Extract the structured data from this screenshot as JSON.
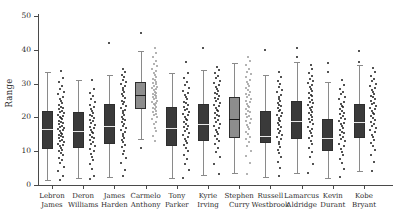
{
  "chart_data": {
    "type": "box",
    "title": "",
    "xlabel": "",
    "ylabel": "Range",
    "ylim": [
      0,
      50
    ],
    "yticks": [
      0,
      10,
      20,
      30,
      40,
      50
    ],
    "grid": false,
    "legend": "none",
    "categories": [
      "Lebron\nJames",
      "Deron\nWilliams",
      "James\nHarden",
      "Carmelo\nAnthony",
      "Tony\nParker",
      "Kyrie\nIrving",
      "Stephen\nCurry",
      "Russell\nWestbrook",
      "Lamarcus\nAldridge",
      "Kevin\nDurant",
      "Kobe\nBryant"
    ],
    "tick_labels": [
      {
        "line1": "Lebron",
        "line2": "James"
      },
      {
        "line1": "Deron",
        "line2": "Williams"
      },
      {
        "line1": "James",
        "line2": "Harden"
      },
      {
        "line1": "Carmelo",
        "line2": "Anthony"
      },
      {
        "line1": "Tony",
        "line2": "Parker"
      },
      {
        "line1": "Kyrie",
        "line2": "Irving"
      },
      {
        "line1": "Stephen",
        "line2": "Curry"
      },
      {
        "line1": "Russell",
        "line2": "Westbrook"
      },
      {
        "line1": "Lamarcus",
        "line2": "Aldridge"
      },
      {
        "line1": "Kevin",
        "line2": "Durant"
      },
      {
        "line1": "Kobe",
        "line2": "Bryant"
      }
    ],
    "box_color_dark": "#3a3a3a",
    "box_color_light": "#8d8d8d",
    "point_color": "#1a1a1a",
    "point_color_light": "#9a9a9a",
    "boxes": [
      {
        "name": "Lebron James",
        "q1": 10.5,
        "median": 16.5,
        "q3": 22.0,
        "whislo": 1.5,
        "whishi": 33.5,
        "shade": "dark",
        "fliers": [],
        "points": [
          33.8,
          31.6,
          30.4,
          29.3,
          28.5,
          27.6,
          26.8,
          26.1,
          25.4,
          24.8,
          24.2,
          23.7,
          23.2,
          22.8,
          22.4,
          22.0,
          21.6,
          21.2,
          20.8,
          20.4,
          20.1,
          19.7,
          19.4,
          19.0,
          18.7,
          18.3,
          18.0,
          17.6,
          17.3,
          16.9,
          16.6,
          16.2,
          15.9,
          15.5,
          15.2,
          14.8,
          14.5,
          14.1,
          13.8,
          13.4,
          13.0,
          12.6,
          12.2,
          11.8,
          11.4,
          11.0,
          10.5,
          10.0,
          9.4,
          8.8,
          8.1,
          7.3,
          6.4,
          5.4,
          4.2,
          2.6,
          1.4
        ]
      },
      {
        "name": "Deron Williams",
        "q1": 11.0,
        "median": 16.0,
        "q3": 21.5,
        "whislo": 2.0,
        "whishi": 31.0,
        "shade": "dark",
        "fliers": [],
        "points": [
          31.2,
          28.4,
          27.2,
          26.2,
          25.3,
          24.5,
          23.8,
          23.1,
          22.5,
          21.9,
          21.3,
          20.8,
          20.3,
          19.8,
          19.3,
          18.8,
          18.3,
          17.8,
          17.3,
          16.8,
          16.3,
          15.8,
          15.3,
          14.8,
          14.3,
          13.8,
          13.2,
          12.6,
          12.0,
          11.4,
          10.7,
          10.0,
          9.2,
          8.3,
          7.3,
          6.1,
          4.6,
          2.7,
          1.8
        ]
      },
      {
        "name": "James Harden",
        "q1": 12.0,
        "median": 17.5,
        "q3": 24.0,
        "whislo": 2.5,
        "whishi": 32.5,
        "shade": "dark",
        "fliers": [
          42.0
        ],
        "points": [
          34.2,
          33.4,
          32.6,
          31.9,
          31.2,
          30.5,
          29.9,
          29.2,
          28.6,
          28.0,
          27.4,
          26.8,
          26.2,
          25.6,
          25.0,
          24.5,
          23.9,
          23.4,
          22.8,
          22.3,
          21.8,
          21.2,
          20.7,
          20.2,
          19.6,
          19.1,
          18.6,
          18.0,
          17.5,
          16.9,
          16.4,
          15.8,
          15.2,
          14.6,
          14.0,
          13.3,
          12.6,
          11.9,
          11.1,
          10.2,
          9.2,
          8.0,
          6.5,
          4.5,
          2.6
        ]
      },
      {
        "name": "Carmelo Anthony",
        "q1": 22.5,
        "median": 26.5,
        "q3": 30.5,
        "whislo": 13.5,
        "whishi": 39.5,
        "shade": "light",
        "fliers": [
          45.0,
          11.0
        ],
        "points": [
          40.5,
          39.0,
          37.8,
          36.8,
          35.9,
          35.1,
          34.4,
          33.7,
          33.1,
          32.5,
          32.0,
          31.5,
          31.0,
          30.6,
          30.2,
          29.8,
          29.4,
          29.0,
          28.7,
          28.3,
          28.0,
          27.6,
          27.3,
          27.0,
          26.6,
          26.3,
          26.0,
          25.6,
          25.3,
          25.0,
          24.6,
          24.3,
          23.9,
          23.6,
          23.2,
          22.8,
          22.4,
          22.0,
          21.6,
          21.1,
          20.6,
          20.0,
          19.4,
          18.7,
          17.9,
          17.0,
          15.9,
          14.6,
          13.0
        ]
      },
      {
        "name": "Tony Parker",
        "q1": 11.5,
        "median": 17.0,
        "q3": 23.0,
        "whislo": 2.0,
        "whishi": 33.0,
        "shade": "dark",
        "fliers": [],
        "points": [
          36.5,
          33.2,
          31.8,
          30.6,
          29.6,
          28.7,
          27.9,
          27.2,
          26.5,
          25.9,
          25.3,
          24.7,
          24.2,
          23.6,
          23.1,
          22.6,
          22.1,
          21.6,
          21.1,
          20.6,
          20.1,
          19.6,
          19.1,
          18.6,
          18.1,
          17.6,
          17.1,
          16.6,
          16.0,
          15.5,
          14.9,
          14.3,
          13.7,
          13.1,
          12.4,
          11.7,
          10.9,
          10.0,
          9.0,
          7.8,
          6.3,
          4.4,
          2.2
        ]
      },
      {
        "name": "Kyrie Irving",
        "q1": 13.0,
        "median": 18.0,
        "q3": 24.0,
        "whislo": 3.0,
        "whishi": 34.0,
        "shade": "dark",
        "fliers": [
          40.5
        ],
        "points": [
          35.0,
          34.0,
          33.1,
          32.3,
          31.6,
          30.9,
          30.2,
          29.6,
          29.0,
          28.4,
          27.9,
          27.3,
          26.8,
          26.3,
          25.8,
          25.3,
          24.8,
          24.3,
          23.8,
          23.3,
          22.8,
          22.3,
          21.8,
          21.3,
          20.8,
          20.3,
          19.8,
          19.2,
          18.7,
          18.1,
          17.6,
          17.0,
          16.4,
          15.8,
          15.1,
          14.4,
          13.7,
          12.9,
          12.0,
          11.0,
          9.8,
          8.3,
          6.3,
          3.4
        ]
      },
      {
        "name": "Stephen Curry",
        "q1": 14.0,
        "median": 19.5,
        "q3": 26.0,
        "whislo": 3.5,
        "whishi": 36.0,
        "shade": "light",
        "fliers": [],
        "points": [
          38.0,
          36.6,
          35.4,
          34.4,
          33.5,
          32.7,
          31.9,
          31.2,
          30.5,
          29.9,
          29.3,
          28.7,
          28.1,
          27.6,
          27.0,
          26.5,
          26.0,
          25.5,
          25.0,
          24.5,
          24.0,
          23.5,
          23.0,
          22.5,
          22.0,
          21.5,
          21.0,
          20.5,
          20.0,
          19.4,
          18.9,
          18.3,
          17.7,
          17.1,
          16.5,
          15.8,
          15.1,
          14.3,
          13.5,
          12.6,
          11.5,
          10.2,
          8.6,
          6.4,
          3.2
        ]
      },
      {
        "name": "Russell Westbrook",
        "q1": 12.5,
        "median": 14.5,
        "q3": 22.0,
        "whislo": 2.5,
        "whishi": 32.5,
        "shade": "dark",
        "fliers": [
          40.0
        ],
        "points": [
          33.5,
          32.0,
          30.8,
          29.8,
          28.9,
          28.1,
          27.4,
          26.7,
          26.1,
          25.5,
          24.9,
          24.4,
          23.8,
          23.3,
          22.8,
          22.3,
          21.8,
          21.3,
          20.8,
          20.3,
          19.8,
          19.3,
          18.8,
          18.2,
          17.7,
          17.1,
          16.6,
          16.0,
          15.4,
          14.8,
          14.2,
          13.5,
          12.8,
          12.1,
          11.3,
          10.4,
          9.4,
          8.2,
          6.8,
          5.0,
          2.6
        ]
      },
      {
        "name": "Lamarcus Aldridge",
        "q1": 13.5,
        "median": 19.0,
        "q3": 25.0,
        "whislo": 3.5,
        "whishi": 36.5,
        "shade": "dark",
        "fliers": [
          40.5,
          38.0
        ],
        "points": [
          35.5,
          34.2,
          33.2,
          32.3,
          31.5,
          30.8,
          30.1,
          29.5,
          28.9,
          28.3,
          27.8,
          27.2,
          26.7,
          26.2,
          25.7,
          25.2,
          24.7,
          24.2,
          23.7,
          23.2,
          22.7,
          22.2,
          21.7,
          21.2,
          20.7,
          20.2,
          19.6,
          19.1,
          18.5,
          17.9,
          17.3,
          16.7,
          16.0,
          15.3,
          14.6,
          13.8,
          13.0,
          12.0,
          11.0,
          9.7,
          8.2,
          6.2,
          3.6
        ]
      },
      {
        "name": "Kevin Durant",
        "q1": 10.0,
        "median": 14.0,
        "q3": 19.5,
        "whislo": 2.0,
        "whishi": 30.5,
        "shade": "dark",
        "fliers": [
          36.0,
          33.5
        ],
        "points": [
          31.0,
          29.6,
          28.5,
          27.6,
          26.8,
          26.0,
          25.3,
          24.7,
          24.1,
          23.5,
          23.0,
          22.4,
          21.9,
          21.4,
          20.9,
          20.4,
          19.9,
          19.4,
          18.9,
          18.4,
          17.9,
          17.4,
          16.9,
          16.4,
          15.8,
          15.3,
          14.7,
          14.1,
          13.5,
          12.9,
          12.2,
          11.5,
          10.7,
          9.9,
          8.9,
          7.8,
          6.5,
          4.8,
          2.4
        ]
      },
      {
        "name": "Kobe Bryant",
        "q1": 14.0,
        "median": 18.5,
        "q3": 24.0,
        "whislo": 4.0,
        "whishi": 35.5,
        "shade": "dark",
        "fliers": [
          39.5,
          36.5
        ],
        "points": [
          34.5,
          33.3,
          32.3,
          31.5,
          30.7,
          30.0,
          29.3,
          28.7,
          28.1,
          27.5,
          27.0,
          26.4,
          25.9,
          25.4,
          24.9,
          24.4,
          23.9,
          23.4,
          22.9,
          22.4,
          21.9,
          21.4,
          20.9,
          20.4,
          19.8,
          19.3,
          18.7,
          18.1,
          17.5,
          16.9,
          16.3,
          15.6,
          14.9,
          14.2,
          13.4,
          12.5,
          11.5,
          10.3,
          8.8,
          6.8,
          4.2
        ]
      }
    ]
  }
}
